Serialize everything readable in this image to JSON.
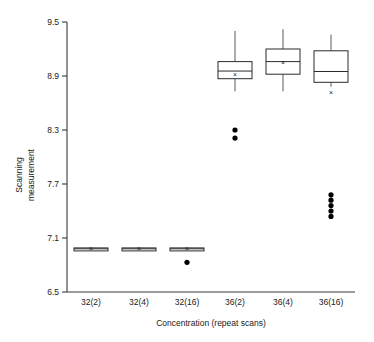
{
  "chart_data": {
    "type": "box",
    "title": "",
    "xlabel": "Concentration (repeat scans)",
    "ylabel": "Scanning\nmeasurement",
    "ylabel_line1": "Scanning",
    "ylabel_line2": "measurement",
    "categories": [
      "32(2)",
      "32(4)",
      "32(16)",
      "36(2)",
      "36(4)",
      "36(16)"
    ],
    "ylim": [
      6.5,
      9.5
    ],
    "yticks": [
      6.5,
      7.1,
      7.7,
      8.3,
      8.9,
      9.5
    ],
    "ytick_labels": [
      "6.5",
      "7.1",
      "7.7",
      "8.3",
      "8.9",
      "9.5"
    ],
    "grid": false,
    "legend": "none",
    "box_colors": {
      "box_fill": "#ffffff",
      "box_stroke": "#2b2b2b",
      "whisker": "#5a5a5a",
      "outlier": "#000000",
      "axis": "#3a3a3a"
    },
    "boxes": [
      {
        "category": "32(2)",
        "whisker_low": 6.97,
        "q1": 6.975,
        "median": 6.98,
        "q3": 6.99,
        "whisker_high": 6.995,
        "mean": 6.98,
        "outliers": []
      },
      {
        "category": "32(4)",
        "whisker_low": 6.97,
        "q1": 6.975,
        "median": 6.98,
        "q3": 6.99,
        "whisker_high": 6.995,
        "mean": 6.98,
        "outliers": []
      },
      {
        "category": "32(16)",
        "whisker_low": 6.97,
        "q1": 6.975,
        "median": 6.98,
        "q3": 6.99,
        "whisker_high": 6.995,
        "mean": 6.98,
        "outliers": [
          6.83
        ]
      },
      {
        "category": "36(2)",
        "whisker_low": 8.73,
        "q1": 8.87,
        "median": 8.955,
        "q3": 9.06,
        "whisker_high": 9.4,
        "mean": 8.92,
        "outliers": [
          8.3,
          8.21
        ]
      },
      {
        "category": "36(4)",
        "whisker_low": 8.73,
        "q1": 8.92,
        "median": 9.06,
        "q3": 9.2,
        "whisker_high": 9.42,
        "mean": 9.05,
        "outliers": []
      },
      {
        "category": "36(16)",
        "whisker_low": 8.78,
        "q1": 8.83,
        "median": 8.95,
        "q3": 9.18,
        "whisker_high": 9.36,
        "mean": 8.72,
        "outliers": [
          7.58,
          7.52,
          7.46,
          7.4,
          7.34
        ]
      }
    ]
  }
}
